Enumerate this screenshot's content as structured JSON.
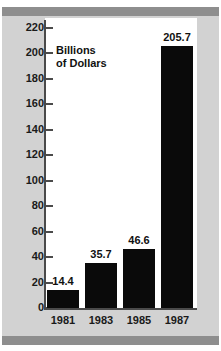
{
  "figure": {
    "title_partial": "",
    "annotation_line1": "Billions",
    "annotation_line2": "of Dollars"
  },
  "chart_data": {
    "type": "bar",
    "title": "",
    "subtitle": "",
    "xlabel": "",
    "ylabel": "Billions of Dollars",
    "categories": [
      "1981",
      "1983",
      "1985",
      "1987"
    ],
    "values": [
      14.4,
      35.7,
      46.6,
      205.7
    ],
    "value_labels": [
      "14.4",
      "35.7",
      "46.6",
      "205.7"
    ],
    "ylim": [
      0,
      220
    ],
    "ytick_values": [
      0,
      20,
      40,
      60,
      80,
      100,
      120,
      140,
      160,
      180,
      200,
      220
    ],
    "ytick_labels": [
      "0",
      "20",
      "40",
      "60",
      "80",
      "100",
      "120",
      "140",
      "160",
      "180",
      "200",
      "220"
    ],
    "grid": false,
    "legend": false,
    "legend_position": "none",
    "bar_color": "#0a0a0a",
    "plot_background": "#ffffff",
    "frame_background": "#d2d2d2",
    "frame_band_color": "#8e8e8e",
    "axis_color": "#4a4a4a",
    "text_color": "#111111"
  }
}
